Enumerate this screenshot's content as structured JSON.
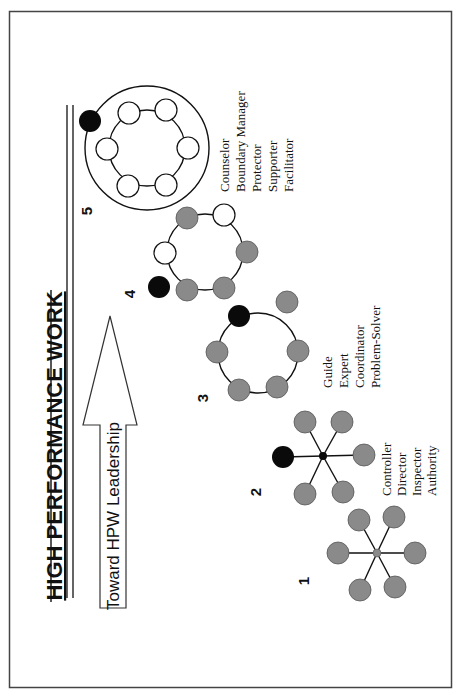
{
  "title": "HIGH PERFORMANCE WORK",
  "arrow": {
    "label": "Toward HPW Leadership"
  },
  "colors": {
    "leader": "#0a0a0a",
    "member_gray": "#8a8a8a",
    "member_white": "#ffffff",
    "stroke": "#111111",
    "frame": "#444444"
  },
  "stages": [
    {
      "number": "1",
      "structure": "hub-and-spoke",
      "leader": "center hub (gray)",
      "members": 6
    },
    {
      "number": "2",
      "structure": "hub-and-spoke",
      "leader": "black node on spoke",
      "members": 5,
      "roles": [
        "Controller",
        "Director",
        "Inspector",
        "Authority"
      ]
    },
    {
      "number": "3",
      "structure": "ring",
      "leader": "black node on ring",
      "members": 5,
      "detached_members": 1,
      "roles": [
        "Guide",
        "Expert",
        "Coordinator",
        "Problem-Solver"
      ]
    },
    {
      "number": "4",
      "structure": "ring",
      "leader": "black node outside ring",
      "members": 6,
      "white_members": 2
    },
    {
      "number": "5",
      "structure": "ring within boundary",
      "leader": "black node on outer boundary",
      "members": 6,
      "white_members": 6,
      "roles": [
        "Counselor",
        "Boundary Manager",
        "Protector",
        "Supporter",
        "Facilitator"
      ]
    }
  ],
  "stage1": {
    "number": "1"
  },
  "stage2": {
    "number": "2",
    "roles": [
      "Controller",
      "Director",
      "Inspector",
      "Authority"
    ]
  },
  "stage3": {
    "number": "3",
    "roles": [
      "Guide",
      "Expert",
      "Coordinator",
      "Problem-Solver"
    ]
  },
  "stage4": {
    "number": "4"
  },
  "stage5": {
    "number": "5",
    "roles": [
      "Counselor",
      "Boundary Manager",
      "Protector",
      "Supporter",
      "Facilitator"
    ]
  }
}
